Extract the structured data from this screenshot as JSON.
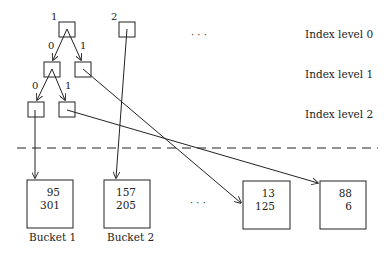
{
  "diagram": {
    "type": "extendible hashing / trie index structure",
    "index_levels": [
      {
        "label": "Index level 0"
      },
      {
        "label": "Index level 1"
      },
      {
        "label": "Index level 2"
      }
    ],
    "root_nodes": [
      {
        "label": "1"
      },
      {
        "label": "2"
      }
    ],
    "edge_labels": {
      "l0_left": "0",
      "l0_right": "1",
      "l1_left": "0",
      "l1_right": "1"
    },
    "ellipsis_top": "· · ·",
    "ellipsis_bottom": "· · ·",
    "buckets": [
      {
        "label": "Bucket 1",
        "values": [
          "95",
          "301"
        ]
      },
      {
        "label": "Bucket 2",
        "values": [
          "157",
          "205"
        ]
      },
      {
        "label": "",
        "values": [
          "13",
          "125"
        ]
      },
      {
        "label": "",
        "values": [
          "88",
          "6"
        ]
      }
    ],
    "separator": "dashed line between index and buckets"
  }
}
